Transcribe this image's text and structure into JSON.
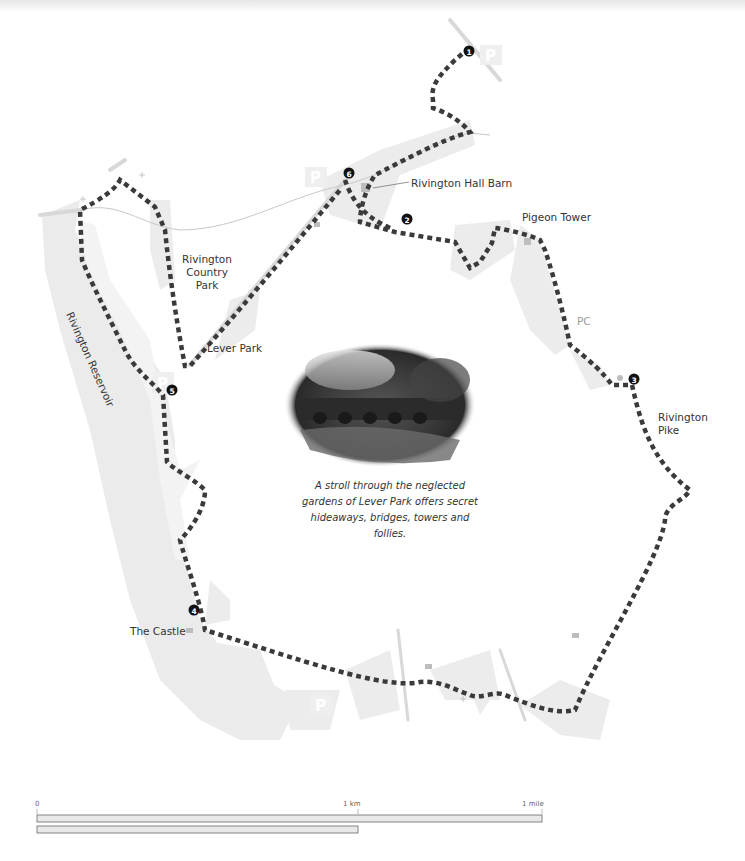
{
  "map": {
    "labels": {
      "hall_barn": "Rivington Hall Barn",
      "pigeon_tower": "Pigeon Tower",
      "country_park_1": "Rivington",
      "country_park_2": "Country",
      "country_park_3": "Park",
      "lever_park": "Lever Park",
      "reservoir": "Rivington Reservoir",
      "pc": "PC",
      "pike_1": "Rivington",
      "pike_2": "Pike",
      "castle": "The Castle"
    },
    "waypoints": [
      {
        "n": "1",
        "x": 469,
        "y": 51
      },
      {
        "n": "2",
        "x": 407,
        "y": 219
      },
      {
        "n": "3",
        "x": 634,
        "y": 379
      },
      {
        "n": "4",
        "x": 194,
        "y": 610
      },
      {
        "n": "5",
        "x": 172,
        "y": 390
      },
      {
        "n": "6",
        "x": 349,
        "y": 173
      }
    ],
    "parking_icon": "P",
    "colors": {
      "route": "#3a3a3a",
      "land": "#ececec",
      "water": "#e4e4e4",
      "road": "#d6d6d6",
      "marker": "#111111"
    }
  },
  "caption": {
    "text": "A stroll through the neglected gardens of Lever Park offers secret hideaways, bridges, towers and follies."
  },
  "scale": {
    "zero": "0",
    "km": "1 km",
    "mile": "1 mile"
  }
}
